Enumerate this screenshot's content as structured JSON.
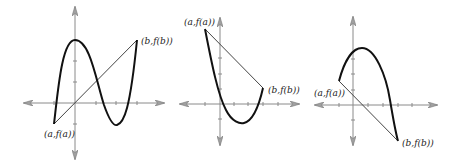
{
  "figure": {
    "colors": {
      "axis": "#8a8a8a",
      "arrow_fill": "#a0a0a0",
      "curve": "#111111",
      "secant": "#444444",
      "text": "#222222"
    }
  },
  "graphs": [
    {
      "id": "graph-1",
      "label_a": "(a,f(a))",
      "label_b": "(b,f(b))",
      "shape": "cubic-like: rises to a maximum at the y-axis, falls to a minimum, then rises steeply to (b,f(b))"
    },
    {
      "id": "graph-2",
      "label_a": "(a,f(a))",
      "label_b": "(b,f(b))",
      "shape": "convex: falls from (a,f(a)) to a minimum below the x-axis, then rises to (b,f(b))"
    },
    {
      "id": "graph-3",
      "label_a": "(a,f(a))",
      "label_b": "(b,f(b))",
      "shape": "concave: rises from (a,f(a)) to a maximum, then falls steeply to (b,f(b)) below the x-axis"
    }
  ]
}
